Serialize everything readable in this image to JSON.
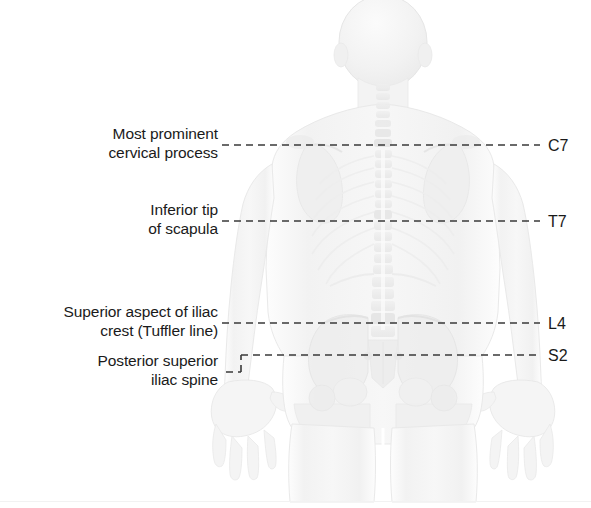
{
  "figure": {
    "view": "posterior",
    "body_tint": "#f4f4f4",
    "outline_color": "#e2e2e2",
    "bone_color": "#ededed"
  },
  "annotations": {
    "leader_color": "#3a3a3a",
    "leader_dash": "7,5",
    "leader_width": 1.6,
    "left_labels": [
      {
        "id": "c7-label",
        "text": "Most prominent\ncervical process",
        "anchor_x": 218,
        "anchor_y": 124,
        "line_y": 145,
        "line_x_start": 222,
        "line_x_end": 540
      },
      {
        "id": "t7-label",
        "text": "Inferior tip\nof scapula",
        "anchor_x": 218,
        "anchor_y": 200,
        "line_y": 221,
        "line_x_start": 222,
        "line_x_end": 540
      },
      {
        "id": "l4-label",
        "text": "Superior aspect of iliac\ncrest (Tuffler line)",
        "anchor_x": 218,
        "anchor_y": 302,
        "line_y": 323,
        "line_x_start": 222,
        "line_x_end": 540
      },
      {
        "id": "s2-label",
        "text": "Posterior superior\niliac spine",
        "anchor_x": 218,
        "anchor_y": 351,
        "line_y": 355,
        "line_x_start": 241,
        "line_x_end": 540,
        "stub_y": 372,
        "stub_x_start": 226,
        "stub_x_end": 241,
        "riser_x": 241
      }
    ],
    "right_labels": [
      {
        "id": "vertebra-c7",
        "text": "C7",
        "x": 548,
        "y": 136
      },
      {
        "id": "vertebra-t7",
        "text": "T7",
        "x": 548,
        "y": 212
      },
      {
        "id": "vertebra-l4",
        "text": "L4",
        "x": 548,
        "y": 314
      },
      {
        "id": "vertebra-s2",
        "text": "S2",
        "x": 548,
        "y": 346
      }
    ]
  }
}
